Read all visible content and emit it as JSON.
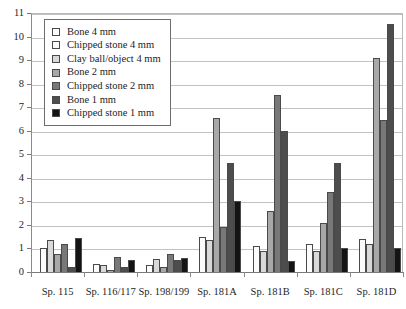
{
  "chart_data": {
    "type": "bar",
    "title": "",
    "xlabel": "",
    "ylabel": "",
    "ylim": [
      0,
      11
    ],
    "ytick_labels": [
      "0",
      "1",
      "2",
      "3",
      "4",
      "5",
      "6",
      "7",
      "8",
      "9",
      "10",
      "11"
    ],
    "grid": true,
    "legend_position": "top-left",
    "categories": [
      "Sp. 115",
      "Sp. 116/117",
      "Sp. 198/199",
      "Sp. 181A",
      "Sp. 181B",
      "Sp. 181C",
      "Sp. 181D"
    ],
    "series": [
      {
        "name": "Bone 4 mm",
        "color": "#ffffff",
        "values": [
          0.0,
          0.0,
          0.0,
          0.0,
          0.0,
          0.0,
          0.0
        ]
      },
      {
        "name": "Chipped stone 4 mm",
        "color": "#fbfbfb",
        "values": [
          1.0,
          0.35,
          0.3,
          1.5,
          1.1,
          1.2,
          1.4
        ]
      },
      {
        "name": "Clay ball/object 4 mm",
        "color": "#d9d9d9",
        "values": [
          1.35,
          0.3,
          0.55,
          1.35,
          0.9,
          0.9,
          1.2
        ]
      },
      {
        "name": "Bone 2 mm",
        "color": "#a8a8a8",
        "values": [
          0.75,
          0.1,
          0.2,
          6.55,
          2.6,
          2.1,
          9.1
        ]
      },
      {
        "name": "Chipped stone 2 mm",
        "color": "#787878",
        "values": [
          1.2,
          0.65,
          0.75,
          1.9,
          7.5,
          3.4,
          6.45
        ]
      },
      {
        "name": "Bone 1 mm",
        "color": "#4d4d4d",
        "values": [
          0.2,
          0.2,
          0.5,
          4.65,
          6.0,
          4.65,
          10.55
        ]
      },
      {
        "name": "Chipped stone 1 mm",
        "color": "#141414",
        "values": [
          1.45,
          0.5,
          0.6,
          3.0,
          0.45,
          1.0,
          1.0
        ]
      }
    ]
  },
  "legend": {
    "entries": [
      {
        "label": "Bone 4 mm",
        "color": "#ffffff"
      },
      {
        "label": "Chipped stone 4 mm",
        "color": "#fbfbfb"
      },
      {
        "label": "Clay ball/object 4 mm",
        "color": "#d9d9d9"
      },
      {
        "label": "Bone 2 mm",
        "color": "#a8a8a8"
      },
      {
        "label": "Chipped stone 2 mm",
        "color": "#787878"
      },
      {
        "label": "Bone 1 mm",
        "color": "#4d4d4d"
      },
      {
        "label": "Chipped stone 1 mm",
        "color": "#141414"
      }
    ]
  }
}
